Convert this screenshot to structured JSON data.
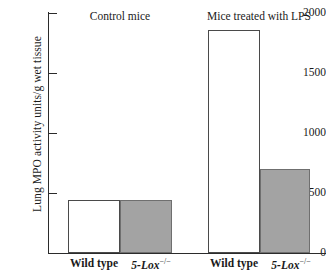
{
  "chart_data": {
    "type": "bar",
    "title": "",
    "xlabel": "",
    "ylabel": "Lung MPO activity units/g wet tissue",
    "ylim": [
      0,
      2000
    ],
    "yticks": [
      0,
      500,
      1000,
      1500,
      2000
    ],
    "ytick_labels": [
      "0",
      "500",
      "1000",
      "1500",
      "2000"
    ],
    "grid": false,
    "legend": "none",
    "groups": [
      {
        "label": "Control mice",
        "bars": [
          {
            "category": "Wild type",
            "gene_label": "",
            "superscript": "",
            "value": 440,
            "style": "open"
          },
          {
            "category": "",
            "gene_label": "5-Lox",
            "superscript": "−/−",
            "value": 440,
            "style": "filled"
          }
        ]
      },
      {
        "label": "Mice treated with LPS",
        "bars": [
          {
            "category": "Wild type",
            "gene_label": "",
            "superscript": "",
            "value": 1860,
            "style": "open"
          },
          {
            "category": "",
            "gene_label": "5-Lox",
            "superscript": "−/−",
            "value": 700,
            "style": "filled"
          }
        ]
      }
    ],
    "categories": [
      "Wild type (control)",
      "5-Lox -/- (control)",
      "Wild type (LPS)",
      "5-Lox -/- (LPS)"
    ],
    "values": [
      440,
      440,
      1860,
      700
    ],
    "colors": {
      "open_bar_fill": "#ffffff",
      "open_bar_edge": "#4a4a4a",
      "filled_bar_fill": "#a3a3a3",
      "filled_bar_edge": "#6f6f6f",
      "axis": "#2b2b2b",
      "text": "#1a1a1a",
      "background": "#ffffff"
    }
  },
  "axis": {
    "y_label": "Lung MPO activity units/g wet tissue",
    "ticks": [
      {
        "label": "2000"
      },
      {
        "label": "1500"
      },
      {
        "label": "1000"
      },
      {
        "label": "500"
      },
      {
        "label": "0"
      }
    ]
  },
  "titles": {
    "left": "Control mice",
    "right": "Mice treated with LPS"
  },
  "xlabels": {
    "wild_type": "Wild type",
    "gene": "5-Lox",
    "superscript": "−/−"
  }
}
